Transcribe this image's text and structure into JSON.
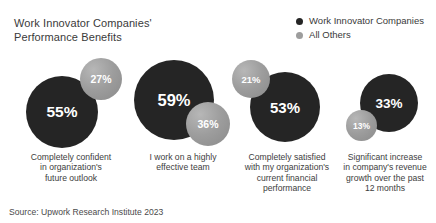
{
  "title": "Work Innovator Companies'\nPerformance Benefits",
  "source": "Source: Upwork Research Institute 2023",
  "legend": {
    "items": [
      {
        "label": "Work Innovator Companies",
        "color": "#252525",
        "marker": "circle-dot-dark"
      },
      {
        "label": "All Others",
        "color": "#9d9d9d",
        "marker": "circle-dot-light"
      }
    ]
  },
  "chart_data": {
    "type": "bubble",
    "title": "Work Innovator Companies' Performance Benefits",
    "subtitle": "",
    "xlabel": "",
    "ylabel": "",
    "unit": "%",
    "legend_position": "top-right",
    "grid": false,
    "source": "Source: Upwork Research Institute 2023",
    "categories": [
      "Completely confident\nin organization's\nfuture outlook",
      "I work on a highly\neffective team",
      "Completely satisfied\nwith my organization's\ncurrent financial\nperformance",
      "Significant increase\nin company's revenue\ngrowth over the past\n12 months"
    ],
    "series": [
      {
        "name": "Work Innovator Companies",
        "color": "#252525",
        "values": [
          55,
          59,
          53,
          33
        ],
        "labels": [
          "55%",
          "59%",
          "53%",
          "33%"
        ]
      },
      {
        "name": "All Others",
        "color": "#9d9d9d",
        "values": [
          27,
          36,
          21,
          13
        ],
        "labels": [
          "27%",
          "36%",
          "21%",
          "13%"
        ]
      }
    ]
  },
  "groups": [
    {
      "category": "Completely confident\nin organization's\nfuture outlook",
      "label_left": 12,
      "label_width": 118,
      "group_left": 22,
      "group_width": 105,
      "dark": {
        "value": "55%",
        "size": 72,
        "x": 4,
        "y": 24,
        "font": 15.5
      },
      "light": {
        "value": "27%",
        "size": 42,
        "x": 58,
        "y": 6,
        "font": 10.5
      }
    },
    {
      "category": "I work on a highly\neffective team",
      "label_left": 131,
      "label_width": 104,
      "group_left": 128,
      "group_width": 105,
      "dark": {
        "size": 80,
        "value": "59%",
        "x": 6,
        "y": 8,
        "font": 16.5
      },
      "light": {
        "size": 44,
        "value": "36%",
        "x": 58,
        "y": 50,
        "font": 10.5
      }
    },
    {
      "category": "Completely satisfied\nwith my organization's\ncurrent financial\nperformance",
      "label_left": 229,
      "label_width": 116,
      "group_left": 232,
      "group_width": 100,
      "dark": {
        "size": 70,
        "value": "53%",
        "x": 18,
        "y": 20,
        "font": 15
      },
      "light": {
        "size": 38,
        "value": "21%",
        "x": 0,
        "y": 8,
        "font": 9.5
      }
    },
    {
      "category": "Significant increase\nin company's revenue\ngrowth over the past\n12 months",
      "label_left": 336,
      "label_width": 98,
      "group_left": 346,
      "group_width": 88,
      "dark": {
        "size": 58,
        "value": "33%",
        "x": 14,
        "y": 22,
        "font": 13.5
      },
      "light": {
        "size": 31,
        "value": "13%",
        "x": 0,
        "y": 58,
        "font": 8.5
      }
    }
  ]
}
